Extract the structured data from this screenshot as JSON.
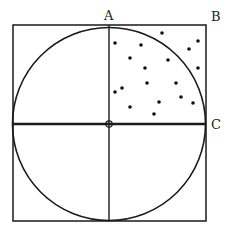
{
  "diagram": {
    "labels": {
      "A": "A",
      "B": "B",
      "C": "C"
    },
    "square": {
      "x": 13,
      "y": 25,
      "size": 193
    },
    "circle": {
      "cx": 109,
      "cy": 124,
      "r": 96
    },
    "origin": {
      "x": 109,
      "y": 124,
      "r": 3
    },
    "dots": [
      [
        162,
        33
      ],
      [
        115,
        43
      ],
      [
        141,
        45
      ],
      [
        198,
        41
      ],
      [
        189,
        49
      ],
      [
        130,
        58
      ],
      [
        168,
        60
      ],
      [
        145,
        68
      ],
      [
        198,
        68
      ],
      [
        147,
        83
      ],
      [
        176,
        83
      ],
      [
        122,
        88
      ],
      [
        115,
        92
      ],
      [
        181,
        97
      ],
      [
        159,
        102
      ],
      [
        193,
        103
      ],
      [
        130,
        107
      ],
      [
        154,
        114
      ]
    ],
    "colors": {
      "stroke": "#1a1a1a",
      "dot": "#111111",
      "label": "#222222"
    }
  }
}
